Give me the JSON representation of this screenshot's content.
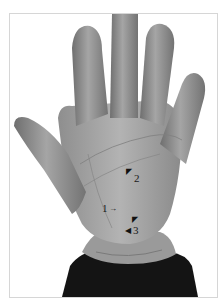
{
  "figure": {
    "annotations": [
      {
        "label": "1",
        "arrow": "right"
      },
      {
        "label": "2",
        "arrow": "up-left"
      },
      {
        "label": "3",
        "arrow": "left"
      }
    ],
    "extra_arrow": {
      "direction": "up-left",
      "near_label": "3"
    },
    "colors": {
      "skin": "#a8a8a8",
      "skin_shadow": "#7d7d7d",
      "sleeve": "#141414",
      "frame_border": "#d6d6d6",
      "background": "#ffffff"
    }
  }
}
